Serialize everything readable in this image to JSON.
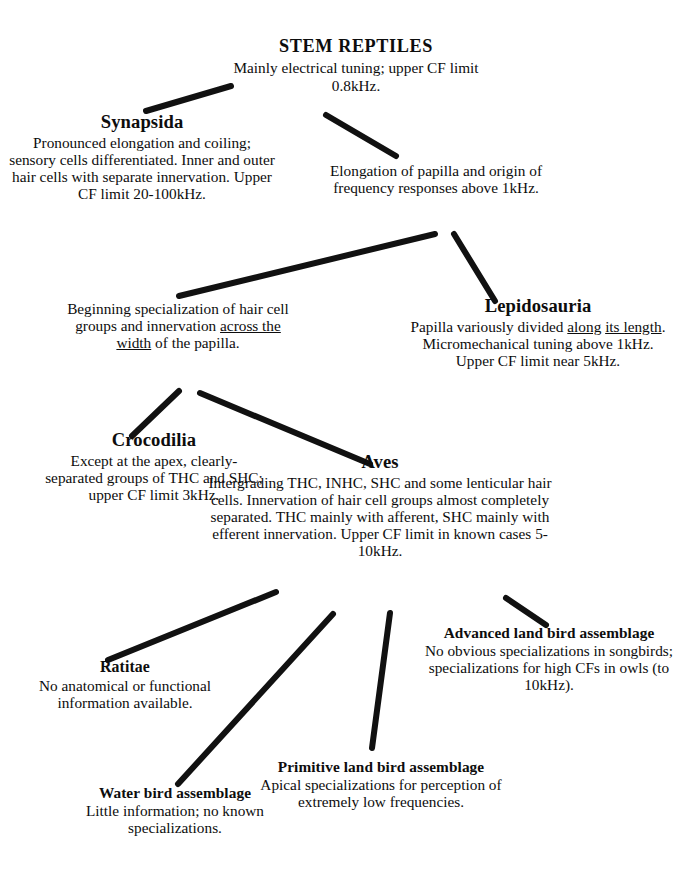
{
  "diagram": {
    "type": "phylogenetic-tree",
    "line_color": "#111111",
    "background_color": "#ffffff",
    "nodes": [
      {
        "id": "stem_reptiles",
        "title": "STEM REPTILES",
        "body": "Mainly electrical tuning; upper CF limit 0.8kHz."
      },
      {
        "id": "synapsida",
        "title": "Synapsida",
        "body": "Pronounced elongation and coiling; sensory cells differentiated. Inner and outer hair cells with separate innervation. Upper CF limit 20-100kHz."
      },
      {
        "id": "elongation",
        "title": "",
        "body": "Elongation of papilla and origin of frequency responses above 1kHz."
      },
      {
        "id": "beginning_specialization",
        "title": "",
        "body_pre": "Beginning specialization of hair cell groups and innervation ",
        "body_underlined_1": "across the",
        "body_underlined_2": "width",
        "body_post": " of the papilla.",
        "body": "Beginning specialization of hair cell groups and innervation across the width of the papilla."
      },
      {
        "id": "lepidosauria",
        "title": "Lepidosauria",
        "body_pre": "Papilla variously divided ",
        "body_underlined_1": "along",
        "body_underlined_2": "its length",
        "body_post": ". Micromechanical tuning above 1kHz. Upper CF limit near 5kHz.",
        "body": "Papilla variously divided along its length. Micromechanical tuning above 1kHz. Upper CF limit near 5kHz."
      },
      {
        "id": "crocodilia",
        "title": "Crocodilia",
        "body": "Except at the apex, clearly-separated groups of THC and SHC; upper CF limit 3kHz."
      },
      {
        "id": "aves",
        "title": "Aves",
        "body": "Intergrading THC, INHC, SHC and some lenticular hair cells. Innervation of hair cell groups almost completely separated. THC mainly with afferent, SHC mainly with efferent innervation. Upper CF limit in known cases 5-10kHz."
      },
      {
        "id": "ratitae",
        "title": "Ratitae",
        "body": "No anatomical or functional information available."
      },
      {
        "id": "water_bird",
        "title": "Water bird assemblage",
        "body": "Little information; no known specializations."
      },
      {
        "id": "primitive_land_bird",
        "title": "Primitive land bird assemblage",
        "body": "Apical specializations for perception of extremely low frequencies."
      },
      {
        "id": "advanced_land_bird",
        "title": "Advanced land bird assemblage",
        "body": "No obvious specializations in songbirds; specializations for high CFs in owls (to 10kHz)."
      }
    ],
    "lines": {
      "stem_to_synapsida": {
        "x1": 231,
        "y1": 86,
        "x2": 146,
        "y2": 111
      },
      "stem_to_elongation": {
        "x1": 326,
        "y1": 115,
        "x2": 396,
        "y2": 156
      },
      "elongation_to_beginning": {
        "x1": 435,
        "y1": 234,
        "x2": 179,
        "y2": 296
      },
      "elongation_to_lepido": {
        "x1": 454,
        "y1": 234,
        "x2": 495,
        "y2": 301
      },
      "beginning_to_crocodilia": {
        "x1": 179,
        "y1": 391,
        "x2": 132,
        "y2": 436
      },
      "beginning_to_aves": {
        "x1": 200,
        "y1": 393,
        "x2": 370,
        "y2": 464
      },
      "aves_to_ratitae": {
        "x1": 276,
        "y1": 592,
        "x2": 108,
        "y2": 660
      },
      "aves_to_water_bird": {
        "x1": 333,
        "y1": 614,
        "x2": 178,
        "y2": 784
      },
      "aves_to_primitive": {
        "x1": 390,
        "y1": 613,
        "x2": 372,
        "y2": 748
      },
      "aves_to_advanced": {
        "x1": 506,
        "y1": 598,
        "x2": 546,
        "y2": 625
      }
    }
  }
}
